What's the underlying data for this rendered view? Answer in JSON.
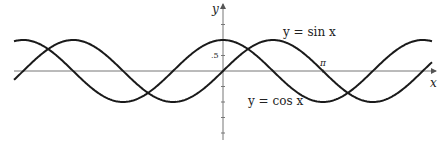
{
  "chart_data": {
    "type": "line",
    "title": "",
    "xlabel": "x",
    "ylabel": "y",
    "xlim": [
      -6.57,
      6.57
    ],
    "ylim": [
      -2.3,
      2.3
    ],
    "ticks": {
      "y_labels": [
        {
          "value": 0.5,
          "label": ".5"
        }
      ],
      "x_labels": [
        {
          "value": 3.14159,
          "label": "π"
        }
      ]
    },
    "series": [
      {
        "name": "y = sin x",
        "function": "sin"
      },
      {
        "name": "y = cos x",
        "function": "cos"
      }
    ],
    "grid": false,
    "annotations": [
      "y = sin x",
      "y = cos x"
    ]
  },
  "colors": {
    "curve": "#1a1a1a",
    "axis": "#777777"
  }
}
